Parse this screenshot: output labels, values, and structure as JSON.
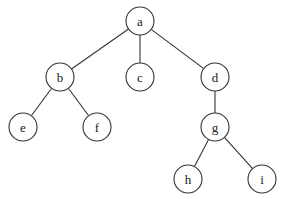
{
  "diagram": {
    "type": "tree",
    "root": "a",
    "node_radius": 14,
    "colors": {
      "stroke": "#333333",
      "fill": "#ffffff",
      "text": "#222222"
    },
    "nodes": [
      {
        "id": "a",
        "label": "a",
        "x": 140,
        "y": 21
      },
      {
        "id": "b",
        "label": "b",
        "x": 60,
        "y": 77
      },
      {
        "id": "c",
        "label": "c",
        "x": 140,
        "y": 77
      },
      {
        "id": "d",
        "label": "d",
        "x": 215,
        "y": 77
      },
      {
        "id": "e",
        "label": "e",
        "x": 23,
        "y": 127
      },
      {
        "id": "f",
        "label": "f",
        "x": 97,
        "y": 127
      },
      {
        "id": "g",
        "label": "g",
        "x": 215,
        "y": 127
      },
      {
        "id": "h",
        "label": "h",
        "x": 188,
        "y": 179
      },
      {
        "id": "i",
        "label": "i",
        "x": 262,
        "y": 179
      }
    ],
    "edges": [
      [
        "a",
        "b"
      ],
      [
        "a",
        "c"
      ],
      [
        "a",
        "d"
      ],
      [
        "b",
        "e"
      ],
      [
        "b",
        "f"
      ],
      [
        "d",
        "g"
      ],
      [
        "g",
        "h"
      ],
      [
        "g",
        "i"
      ]
    ]
  }
}
